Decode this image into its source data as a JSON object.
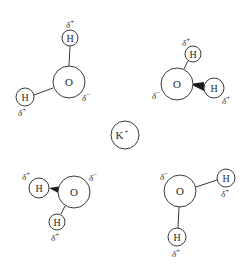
{
  "diagram": {
    "center_ion": {
      "label": "K",
      "charge": "+"
    },
    "molecules": [
      {
        "position": "top-left",
        "oxygen": {
          "label": "O",
          "partial_charge": "δ",
          "sign": "−"
        },
        "hydrogens": [
          {
            "label": "H",
            "partial_charge": "δ",
            "sign": "+"
          },
          {
            "label": "H",
            "partial_charge": "δ",
            "sign": "+"
          }
        ]
      },
      {
        "position": "top-right",
        "oxygen": {
          "label": "O",
          "partial_charge": "δ",
          "sign": "−"
        },
        "hydrogens": [
          {
            "label": "H",
            "partial_charge": "δ",
            "sign": "+"
          },
          {
            "label": "H",
            "partial_charge": "δ",
            "sign": "+"
          }
        ]
      },
      {
        "position": "bottom-left",
        "oxygen": {
          "label": "O",
          "partial_charge": "δ",
          "sign": "−"
        },
        "hydrogens": [
          {
            "label": "H",
            "partial_charge": "δ",
            "sign": "+"
          },
          {
            "label": "H",
            "partial_charge": "δ",
            "sign": "+"
          }
        ]
      },
      {
        "position": "bottom-right",
        "oxygen": {
          "label": "O",
          "partial_charge": "δ",
          "sign": "−"
        },
        "hydrogens": [
          {
            "label": "H",
            "partial_charge": "δ",
            "sign": "+"
          },
          {
            "label": "H",
            "partial_charge": "δ",
            "sign": "+"
          }
        ]
      }
    ]
  }
}
